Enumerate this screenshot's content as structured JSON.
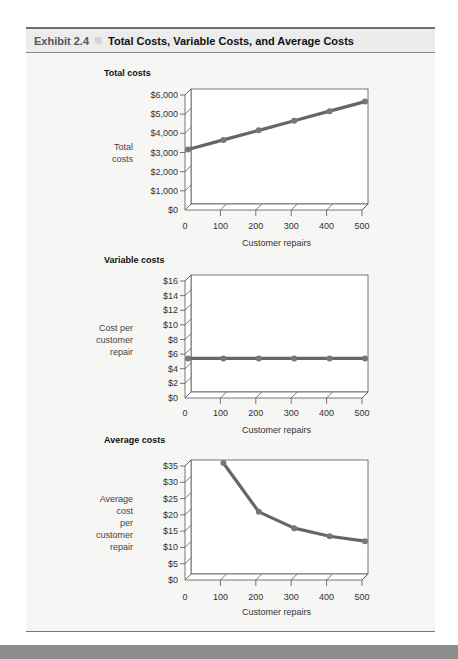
{
  "header": {
    "exhibit_number": "Exhibit 2.4",
    "title": "Total Costs, Variable Costs, and Average Costs"
  },
  "colors": {
    "line": "#666666",
    "marker": "#777777",
    "panel_bg": "#f6f6f5",
    "plot_bg": "#ffffff"
  },
  "chart_data": [
    {
      "type": "line",
      "title": "Total costs",
      "xlabel": "Customer repairs",
      "ylabel": "Total costs",
      "x": [
        0,
        100,
        200,
        300,
        400,
        500
      ],
      "values": [
        3000,
        3500,
        4000,
        4500,
        5000,
        5500
      ],
      "x_ticks": [
        "0",
        "100",
        "200",
        "300",
        "400",
        "500"
      ],
      "y_ticks": [
        "$0",
        "$1,000",
        "$2,000",
        "$3,000",
        "$4,000",
        "$5,000",
        "$6,000"
      ],
      "ylim": [
        0,
        6000
      ],
      "xlim": [
        0,
        500
      ],
      "grid": false,
      "legend": null
    },
    {
      "type": "line",
      "title": "Variable costs",
      "xlabel": "Customer repairs",
      "ylabel": "Cost per customer repair",
      "x": [
        0,
        100,
        200,
        300,
        400,
        500
      ],
      "values": [
        5,
        5,
        5,
        5,
        5,
        5
      ],
      "x_ticks": [
        "0",
        "100",
        "200",
        "300",
        "400",
        "500"
      ],
      "y_ticks": [
        "$0",
        "$2",
        "$4",
        "$6",
        "$8",
        "$10",
        "$12",
        "$14",
        "$16"
      ],
      "ylim": [
        0,
        16
      ],
      "xlim": [
        0,
        500
      ],
      "grid": false,
      "legend": null
    },
    {
      "type": "line",
      "title": "Average costs",
      "xlabel": "Customer repairs",
      "ylabel": "Average cost per customer repair",
      "x": [
        100,
        200,
        300,
        400,
        500
      ],
      "values": [
        35,
        20,
        15,
        12.5,
        11
      ],
      "x_ticks": [
        "0",
        "100",
        "200",
        "300",
        "400",
        "500"
      ],
      "y_ticks": [
        "$0",
        "$5",
        "$10",
        "$15",
        "$20",
        "$25",
        "$30",
        "$35"
      ],
      "ylim": [
        0,
        35
      ],
      "xlim": [
        0,
        500
      ],
      "grid": false,
      "legend": null
    }
  ],
  "charts": [
    {
      "title": "Total costs",
      "ylabel_lines": [
        "Total",
        "costs"
      ],
      "xlabel": "Customer repairs"
    },
    {
      "title": "Variable costs",
      "ylabel_lines": [
        "Cost per",
        "customer",
        "repair"
      ],
      "xlabel": "Customer repairs"
    },
    {
      "title": "Average costs",
      "ylabel_lines": [
        "Average",
        "cost",
        "per",
        "customer",
        "repair"
      ],
      "xlabel": "Customer repairs"
    }
  ]
}
